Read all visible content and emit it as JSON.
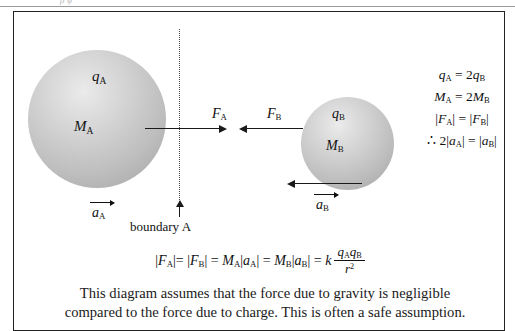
{
  "page": {
    "top_clipped_text": "ρ  ϕ"
  },
  "diagram": {
    "sphere_a": {
      "charge_label": "q",
      "charge_sub": "A",
      "mass_label": "M",
      "mass_sub": "A",
      "accel_label": "a",
      "accel_sub": "A",
      "force_label": "F",
      "force_sub": "A"
    },
    "sphere_b": {
      "charge_label": "q",
      "charge_sub": "B",
      "mass_label": "M",
      "mass_sub": "B",
      "accel_label": "a",
      "accel_sub": "B",
      "force_label": "F",
      "force_sub": "B"
    },
    "boundary": {
      "caption": "boundary A"
    }
  },
  "relations": {
    "line1": {
      "lhs": "q",
      "lhs_sub": "A",
      "op": " = 2",
      "rhs": "q",
      "rhs_sub": "B"
    },
    "line2": {
      "lhs": "M",
      "lhs_sub": "A",
      "op": " = 2",
      "rhs": "M",
      "rhs_sub": "B"
    },
    "line3": {
      "lhs": "F",
      "lhs_sub": "A",
      "op": " = ",
      "rhs": "F",
      "rhs_sub": "B"
    },
    "line4": {
      "prefix": "∴ 2",
      "lhs": "a",
      "lhs_sub": "A",
      "op": " = ",
      "rhs": "a",
      "rhs_sub": "B"
    }
  },
  "main_equation": {
    "text": "|F_A| = |F_B| = M_A|a_A| = M_B|a_B| = k q_A q_B / r^2",
    "numerator": "q_A q_B",
    "denominator": "r^2",
    "coefficient": "k"
  },
  "caption": {
    "line1": "This diagram assumes that the force due to gravity is negligible",
    "line2": "compared to the force due to charge.  This is often a safe assumption."
  }
}
